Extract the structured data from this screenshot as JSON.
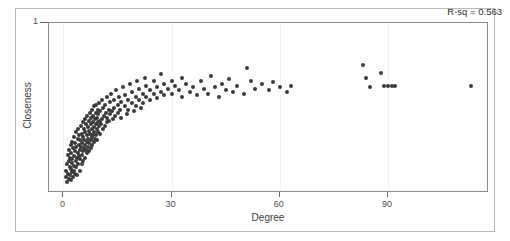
{
  "chart_data": {
    "type": "scatter",
    "title": "",
    "xlabel": "Degree",
    "ylabel": "Closeness",
    "xlim": [
      -4,
      118
    ],
    "ylim": [
      0.0,
      1.06
    ],
    "xticks": [
      0,
      30,
      60,
      90
    ],
    "xtick_labels": [
      "0",
      "30",
      "60",
      "90"
    ],
    "yticks": [
      1
    ],
    "ytick_labels": [
      "1"
    ],
    "grid": "vertical-faint",
    "legend": "none",
    "annotations": [
      {
        "name": "r-squared",
        "text": "R-sq = 0.563",
        "position": "top-right"
      }
    ],
    "marker": {
      "shape": "circle",
      "color": "#3a3a3a",
      "size_px": 4
    },
    "points": [
      [
        0.6,
        0.14
      ],
      [
        0.8,
        0.1
      ],
      [
        1.0,
        0.18
      ],
      [
        1.1,
        0.07
      ],
      [
        1.2,
        0.24
      ],
      [
        1.3,
        0.12
      ],
      [
        1.4,
        0.2
      ],
      [
        1.5,
        0.09
      ],
      [
        1.6,
        0.27
      ],
      [
        1.7,
        0.16
      ],
      [
        1.8,
        0.11
      ],
      [
        1.9,
        0.22
      ],
      [
        2.0,
        0.3
      ],
      [
        2.0,
        0.15
      ],
      [
        2.1,
        0.08
      ],
      [
        2.2,
        0.25
      ],
      [
        2.3,
        0.19
      ],
      [
        2.4,
        0.13
      ],
      [
        2.5,
        0.32
      ],
      [
        2.5,
        0.21
      ],
      [
        2.6,
        0.1
      ],
      [
        2.7,
        0.28
      ],
      [
        2.8,
        0.17
      ],
      [
        2.9,
        0.23
      ],
      [
        3.0,
        0.35
      ],
      [
        3.0,
        0.14
      ],
      [
        3.1,
        0.26
      ],
      [
        3.2,
        0.12
      ],
      [
        3.3,
        0.31
      ],
      [
        3.4,
        0.2
      ],
      [
        3.5,
        0.38
      ],
      [
        3.5,
        0.16
      ],
      [
        3.6,
        0.29
      ],
      [
        3.7,
        0.22
      ],
      [
        3.8,
        0.11
      ],
      [
        3.9,
        0.34
      ],
      [
        4.0,
        0.25
      ],
      [
        4.0,
        0.4
      ],
      [
        4.1,
        0.18
      ],
      [
        4.2,
        0.3
      ],
      [
        4.3,
        0.23
      ],
      [
        4.4,
        0.36
      ],
      [
        4.5,
        0.27
      ],
      [
        4.5,
        0.14
      ],
      [
        4.6,
        0.33
      ],
      [
        4.7,
        0.21
      ],
      [
        4.8,
        0.42
      ],
      [
        4.9,
        0.29
      ],
      [
        5.0,
        0.37
      ],
      [
        5.0,
        0.24
      ],
      [
        5.1,
        0.18
      ],
      [
        5.2,
        0.31
      ],
      [
        5.3,
        0.44
      ],
      [
        5.4,
        0.26
      ],
      [
        5.5,
        0.35
      ],
      [
        5.5,
        0.2
      ],
      [
        5.6,
        0.4
      ],
      [
        5.7,
        0.28
      ],
      [
        5.8,
        0.33
      ],
      [
        5.9,
        0.46
      ],
      [
        6.0,
        0.3
      ],
      [
        6.0,
        0.22
      ],
      [
        6.1,
        0.38
      ],
      [
        6.2,
        0.27
      ],
      [
        6.3,
        0.43
      ],
      [
        6.4,
        0.32
      ],
      [
        6.5,
        0.25
      ],
      [
        6.5,
        0.48
      ],
      [
        6.6,
        0.36
      ],
      [
        6.7,
        0.29
      ],
      [
        6.8,
        0.41
      ],
      [
        6.9,
        0.34
      ],
      [
        7.0,
        0.45
      ],
      [
        7.0,
        0.26
      ],
      [
        7.1,
        0.39
      ],
      [
        7.2,
        0.31
      ],
      [
        7.3,
        0.5
      ],
      [
        7.4,
        0.37
      ],
      [
        7.5,
        0.28
      ],
      [
        7.5,
        0.43
      ],
      [
        7.6,
        0.33
      ],
      [
        7.7,
        0.47
      ],
      [
        7.8,
        0.35
      ],
      [
        7.9,
        0.4
      ],
      [
        8.0,
        0.52
      ],
      [
        8.0,
        0.3
      ],
      [
        8.1,
        0.44
      ],
      [
        8.2,
        0.36
      ],
      [
        8.3,
        0.48
      ],
      [
        8.4,
        0.32
      ],
      [
        8.5,
        0.41
      ],
      [
        8.5,
        0.54
      ],
      [
        8.6,
        0.38
      ],
      [
        8.7,
        0.46
      ],
      [
        8.8,
        0.34
      ],
      [
        8.9,
        0.5
      ],
      [
        9.0,
        0.43
      ],
      [
        9.0,
        0.36
      ],
      [
        9.1,
        0.55
      ],
      [
        9.2,
        0.4
      ],
      [
        9.3,
        0.47
      ],
      [
        9.4,
        0.33
      ],
      [
        9.5,
        0.52
      ],
      [
        9.5,
        0.44
      ],
      [
        9.6,
        0.38
      ],
      [
        9.7,
        0.49
      ],
      [
        9.8,
        0.42
      ],
      [
        9.9,
        0.56
      ],
      [
        10.0,
        0.45
      ],
      [
        10.0,
        0.37
      ],
      [
        10.2,
        0.51
      ],
      [
        10.4,
        0.43
      ],
      [
        10.6,
        0.58
      ],
      [
        10.8,
        0.46
      ],
      [
        11.0,
        0.4
      ],
      [
        11.0,
        0.53
      ],
      [
        11.2,
        0.48
      ],
      [
        11.4,
        0.42
      ],
      [
        11.6,
        0.55
      ],
      [
        11.8,
        0.5
      ],
      [
        12.0,
        0.44
      ],
      [
        12.0,
        0.6
      ],
      [
        12.2,
        0.47
      ],
      [
        12.5,
        0.52
      ],
      [
        12.7,
        0.45
      ],
      [
        13.0,
        0.57
      ],
      [
        13.0,
        0.49
      ],
      [
        13.3,
        0.62
      ],
      [
        13.5,
        0.51
      ],
      [
        13.8,
        0.46
      ],
      [
        14.0,
        0.58
      ],
      [
        14.0,
        0.53
      ],
      [
        14.3,
        0.48
      ],
      [
        14.6,
        0.64
      ],
      [
        15.0,
        0.55
      ],
      [
        15.0,
        0.5
      ],
      [
        15.4,
        0.6
      ],
      [
        15.8,
        0.52
      ],
      [
        16.0,
        0.57
      ],
      [
        16.0,
        0.47
      ],
      [
        16.5,
        0.66
      ],
      [
        17.0,
        0.54
      ],
      [
        17.0,
        0.61
      ],
      [
        17.5,
        0.49
      ],
      [
        18.0,
        0.58
      ],
      [
        18.0,
        0.52
      ],
      [
        18.5,
        0.68
      ],
      [
        19.0,
        0.56
      ],
      [
        19.0,
        0.63
      ],
      [
        19.5,
        0.51
      ],
      [
        20.0,
        0.6
      ],
      [
        20.0,
        0.54
      ],
      [
        20.5,
        0.7
      ],
      [
        21.0,
        0.58
      ],
      [
        21.0,
        0.65
      ],
      [
        21.5,
        0.53
      ],
      [
        22.0,
        0.62
      ],
      [
        22.0,
        0.56
      ],
      [
        22.5,
        0.72
      ],
      [
        23.0,
        0.6
      ],
      [
        23.0,
        0.67
      ],
      [
        24.0,
        0.58
      ],
      [
        24.0,
        0.64
      ],
      [
        25.0,
        0.62
      ],
      [
        25.0,
        0.7
      ],
      [
        26.0,
        0.59
      ],
      [
        26.0,
        0.66
      ],
      [
        27.0,
        0.63
      ],
      [
        27.0,
        0.74
      ],
      [
        28.0,
        0.61
      ],
      [
        28.0,
        0.68
      ],
      [
        29.0,
        0.65
      ],
      [
        30.0,
        0.7
      ],
      [
        30.0,
        0.62
      ],
      [
        31.0,
        0.67
      ],
      [
        32.0,
        0.64
      ],
      [
        33.0,
        0.72
      ],
      [
        33.0,
        0.6
      ],
      [
        34.0,
        0.68
      ],
      [
        35.0,
        0.63
      ],
      [
        36.0,
        0.66
      ],
      [
        37.0,
        0.61
      ],
      [
        38.0,
        0.7
      ],
      [
        39.0,
        0.65
      ],
      [
        40.0,
        0.62
      ],
      [
        41.0,
        0.73
      ],
      [
        42.0,
        0.66
      ],
      [
        43.0,
        0.6
      ],
      [
        44.0,
        0.68
      ],
      [
        45.0,
        0.64
      ],
      [
        46.0,
        0.71
      ],
      [
        47.0,
        0.63
      ],
      [
        48.0,
        0.67
      ],
      [
        50.0,
        0.62
      ],
      [
        51.0,
        0.78
      ],
      [
        52.0,
        0.7
      ],
      [
        53.0,
        0.65
      ],
      [
        55.0,
        0.68
      ],
      [
        57.0,
        0.64
      ],
      [
        58.0,
        0.69
      ],
      [
        60.0,
        0.66
      ],
      [
        62.0,
        0.63
      ],
      [
        63.0,
        0.67
      ],
      [
        83.0,
        0.8
      ],
      [
        84.0,
        0.72
      ],
      [
        85.0,
        0.66
      ],
      [
        88.0,
        0.75
      ],
      [
        89.0,
        0.67
      ],
      [
        90.0,
        0.67
      ],
      [
        91.0,
        0.67
      ],
      [
        92.0,
        0.67
      ],
      [
        113.0,
        0.67
      ]
    ]
  }
}
